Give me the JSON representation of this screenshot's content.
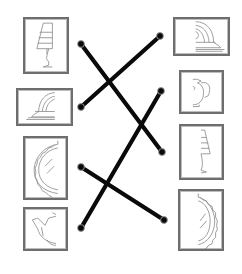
{
  "title": "Match the halves",
  "colors": {
    "line": "#0a0a0a",
    "frame": "#6e6e6e",
    "sketch": "#8a8a8a"
  },
  "left_cards": [
    {
      "id": "L1",
      "object": "lamp",
      "half": "left",
      "box": [
        23,
        17,
        46,
        57
      ]
    },
    {
      "id": "L2",
      "object": "mantel-clock",
      "half": "left",
      "box": [
        16,
        88,
        57,
        38
      ]
    },
    {
      "id": "L3",
      "object": "mirror",
      "half": "left",
      "box": [
        23,
        136,
        45,
        64
      ]
    },
    {
      "id": "L4",
      "object": "teapot",
      "half": "left",
      "box": [
        23,
        207,
        45,
        44
      ]
    }
  ],
  "right_cards": [
    {
      "id": "R1",
      "object": "mantel-clock",
      "half": "right",
      "box": [
        173,
        17,
        57,
        39
      ]
    },
    {
      "id": "R2",
      "object": "teapot",
      "half": "right",
      "box": [
        179,
        70,
        45,
        44
      ]
    },
    {
      "id": "R3",
      "object": "lamp",
      "half": "right",
      "box": [
        179,
        124,
        45,
        56
      ]
    },
    {
      "id": "R4",
      "object": "mirror",
      "half": "right",
      "box": [
        178,
        189,
        46,
        62
      ]
    }
  ],
  "connections": [
    {
      "from": "L1",
      "to": "R3",
      "x1": 81,
      "y1": 44,
      "x2": 162,
      "y2": 152
    },
    {
      "from": "L2",
      "to": "R1",
      "x1": 81,
      "y1": 107,
      "x2": 160,
      "y2": 36
    },
    {
      "from": "L3",
      "to": "R4",
      "x1": 81,
      "y1": 167,
      "x2": 164,
      "y2": 220
    },
    {
      "from": "L4",
      "to": "R2",
      "x1": 81,
      "y1": 228,
      "x2": 161,
      "y2": 91
    }
  ]
}
